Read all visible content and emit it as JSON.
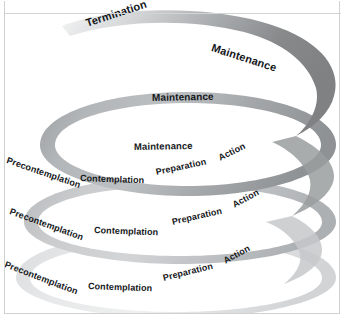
{
  "figure": {
    "type": "spiral-diagram",
    "background_color": "#ffffff",
    "border_color": "#cfd0d1",
    "rule_color": "#d2d3d4",
    "label_color": "#15181b"
  },
  "palette": {
    "band_dark": "#8b8e90",
    "band_mid": "#a8abad",
    "band_light": "#c9cbcd",
    "band_pale": "#e2e3e4",
    "band_white": "#f4f5f5",
    "shadow": "#e6e7e8"
  },
  "spiral": {
    "turns": [
      {
        "index": 0,
        "name": "top-turn",
        "tone": "dark",
        "labels": [
          "Termination",
          "Maintenance"
        ]
      },
      {
        "index": 1,
        "name": "second-turn",
        "tone": "mid",
        "labels": [
          "Maintenance",
          "Precontemplation",
          "Contemplation",
          "Preparation",
          "Action"
        ]
      },
      {
        "index": 2,
        "name": "third-turn",
        "tone": "light",
        "labels": [
          "Maintenance",
          "Precontemplation",
          "Contemplation",
          "Preparation",
          "Action"
        ]
      },
      {
        "index": 3,
        "name": "bottom-turn",
        "tone": "pale",
        "labels": [
          "Precontemplation",
          "Contemplation",
          "Preparation",
          "Action"
        ]
      }
    ]
  },
  "labels": {
    "termination": "Termination",
    "maintenance_1": "Maintenance",
    "maintenance_2": "Maintenance",
    "maintenance_3": "Maintenance",
    "ring1": {
      "precontemplation": "Precontemplation",
      "contemplation": "Contemplation",
      "preparation": "Preparation",
      "action": "Action"
    },
    "ring2": {
      "precontemplation": "Precontemplation",
      "contemplation": "Contemplation",
      "preparation": "Preparation",
      "action": "Action"
    },
    "ring3": {
      "precontemplation": "Precontemplation",
      "contemplation": "Contemplation",
      "preparation": "Preparation",
      "action": "Action"
    }
  }
}
